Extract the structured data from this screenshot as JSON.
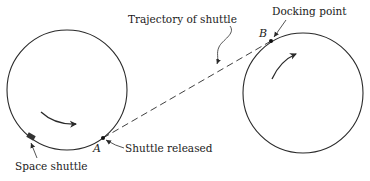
{
  "figure": {
    "type": "orbital docking diagram",
    "labels": {
      "trajectory": "Trajectory of shuttle",
      "docking_point": "Docking point",
      "shuttle_released": "Shuttle released",
      "space_shuttle": "Space shuttle",
      "point_a": "A",
      "point_b": "B"
    },
    "colors": {
      "stroke": "#2a2a2a",
      "text": "#1a1a1a",
      "background": "#ffffff"
    },
    "orbits": [
      {
        "name": "left-orbit",
        "center": [
          67,
          90
        ],
        "radius": 60,
        "rotation": "clockwise"
      },
      {
        "name": "right-orbit",
        "center": [
          303,
          93
        ],
        "radius": 60,
        "rotation": "clockwise"
      }
    ],
    "points": {
      "A": [
        103,
        138
      ],
      "B": [
        271,
        41
      ]
    }
  }
}
